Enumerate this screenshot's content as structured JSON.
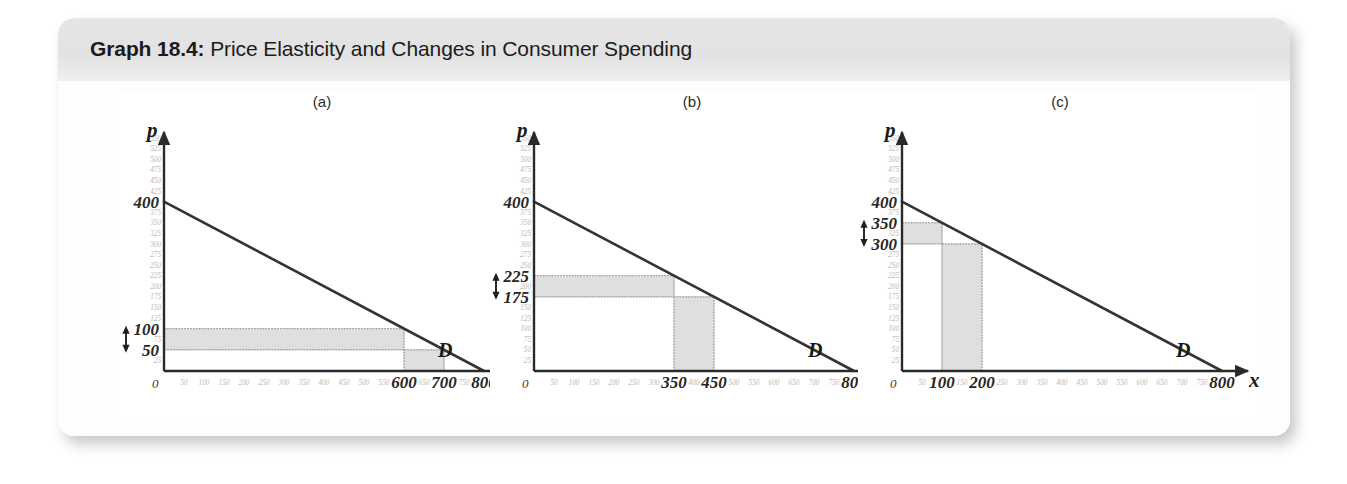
{
  "figure": {
    "title_prefix": "Graph 18.4:",
    "title_rest": " Price Elasticity and Changes in Consumer Spending"
  },
  "chart_data": [
    {
      "type": "line",
      "panel_label": "(a)",
      "title": "(a)",
      "xlabel": "x",
      "ylabel": "p",
      "xlim": [
        0,
        800
      ],
      "ylim": [
        0,
        550
      ],
      "grid": false,
      "curve_name": "D",
      "series": [
        {
          "name": "D",
          "x": [
            0,
            800
          ],
          "y": [
            400,
            0
          ]
        }
      ],
      "x_ticks_faint": [
        50,
        100,
        150,
        200,
        250,
        300,
        350,
        400,
        450,
        500,
        550,
        650,
        750
      ],
      "x_ticks_bold": [
        600,
        700,
        800
      ],
      "y_ticks_faint": [
        25,
        75,
        125,
        150,
        175,
        200,
        225,
        250,
        275,
        300,
        325,
        350,
        375,
        425,
        450,
        475,
        500,
        525,
        550
      ],
      "y_ticks_bold": [
        50,
        100,
        400
      ],
      "origin_label": "0",
      "price_high": 100,
      "price_low": 50,
      "quantity_low": 600,
      "quantity_high": 700,
      "price_arrow": {
        "from": 50,
        "to": 100
      },
      "regions": [
        {
          "name": "revenue-lost-horizontal",
          "x0": 0,
          "x1": 600,
          "y0": 50,
          "y1": 100
        },
        {
          "name": "revenue-gained-vertical",
          "x0": 600,
          "x1": 700,
          "y0": 0,
          "y1": 50
        }
      ]
    },
    {
      "type": "line",
      "panel_label": "(b)",
      "title": "(b)",
      "xlabel": "x",
      "ylabel": "p",
      "xlim": [
        0,
        800
      ],
      "ylim": [
        0,
        550
      ],
      "grid": false,
      "curve_name": "D",
      "series": [
        {
          "name": "D",
          "x": [
            0,
            800
          ],
          "y": [
            400,
            0
          ]
        }
      ],
      "x_ticks_faint": [
        50,
        100,
        150,
        200,
        250,
        300,
        400,
        500,
        550,
        600,
        650,
        700,
        750
      ],
      "x_ticks_bold": [
        350,
        450,
        800
      ],
      "y_ticks_faint": [
        25,
        50,
        75,
        100,
        125,
        150,
        200,
        250,
        275,
        300,
        325,
        350,
        375,
        425,
        450,
        475,
        500,
        525,
        550
      ],
      "y_ticks_bold": [
        175,
        225,
        400
      ],
      "origin_label": "0",
      "price_high": 225,
      "price_low": 175,
      "quantity_low": 350,
      "quantity_high": 450,
      "price_arrow": {
        "from": 175,
        "to": 225
      },
      "regions": [
        {
          "name": "revenue-lost-horizontal",
          "x0": 0,
          "x1": 350,
          "y0": 175,
          "y1": 225
        },
        {
          "name": "revenue-gained-vertical",
          "x0": 350,
          "x1": 450,
          "y0": 0,
          "y1": 175
        }
      ]
    },
    {
      "type": "line",
      "panel_label": "(c)",
      "title": "(c)",
      "xlabel": "x",
      "ylabel": "p",
      "xlim": [
        0,
        800
      ],
      "ylim": [
        0,
        550
      ],
      "grid": false,
      "curve_name": "D",
      "series": [
        {
          "name": "D",
          "x": [
            0,
            800
          ],
          "y": [
            400,
            0
          ]
        }
      ],
      "x_ticks_faint": [
        50,
        150,
        250,
        300,
        350,
        400,
        450,
        500,
        550,
        600,
        650,
        700,
        750
      ],
      "x_ticks_bold": [
        100,
        200,
        800
      ],
      "y_ticks_faint": [
        25,
        50,
        75,
        100,
        125,
        150,
        175,
        200,
        225,
        250,
        275,
        325,
        375,
        425,
        450,
        475,
        500,
        525,
        550
      ],
      "y_ticks_bold": [
        300,
        350,
        400
      ],
      "origin_label": "0",
      "price_high": 350,
      "price_low": 300,
      "quantity_low": 100,
      "quantity_high": 200,
      "price_arrow": {
        "from": 300,
        "to": 350
      },
      "regions": [
        {
          "name": "revenue-lost-horizontal",
          "x0": 0,
          "x1": 100,
          "y0": 300,
          "y1": 350
        },
        {
          "name": "revenue-gained-vertical",
          "x0": 100,
          "x1": 200,
          "y0": 0,
          "y1": 300
        }
      ]
    }
  ],
  "colors": {
    "card_background": "#fdfdfd",
    "title_band": "#e3e3e3",
    "axis": "#2a2a2a",
    "curve": "#333333",
    "shaded_region": "#d8d8d8",
    "faint_tick": "#b9b9b9",
    "bold_label": "#262626"
  }
}
